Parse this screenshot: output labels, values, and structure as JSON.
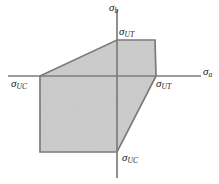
{
  "figure": {
    "background_color": "#ffffff",
    "fill_color": "#cccccc",
    "stroke_color": "#7a7a7a",
    "axis_color": "#7d7d7d",
    "width": 219,
    "height": 184
  },
  "axes": {
    "horizontal": {
      "name": "sigma-a-axis",
      "label_symbol": "σ",
      "label_subscript": "a",
      "x_start": 8,
      "x_end": 201,
      "y": 76
    },
    "vertical": {
      "name": "sigma-b-axis",
      "label_symbol": "σ",
      "label_subscript": "b",
      "x": 117,
      "y_start": 10,
      "y_end": 178
    }
  },
  "labels": {
    "sigma_b": {
      "symbol": "σ",
      "subscript": "b"
    },
    "sigma_a": {
      "symbol": "σ",
      "subscript": "a"
    },
    "sigma_ut_top": {
      "symbol": "σ",
      "subscript": "UT"
    },
    "sigma_ut_right": {
      "symbol": "σ",
      "subscript": "UT"
    },
    "sigma_uc_left": {
      "symbol": "σ",
      "subscript": "UC"
    },
    "sigma_uc_bottom": {
      "symbol": "σ",
      "subscript": "UC"
    }
  },
  "chart_data": {
    "type": "line",
    "xlabel": "σa",
    "ylabel": "σb",
    "grid": false,
    "legend": null,
    "origin_px": {
      "x": 117,
      "y": 76
    },
    "envelope_polygon_px": [
      {
        "x": 40,
        "y": 76
      },
      {
        "x": 117,
        "y": 40
      },
      {
        "x": 155,
        "y": 40
      },
      {
        "x": 156,
        "y": 76
      },
      {
        "x": 117,
        "y": 152
      },
      {
        "x": 40,
        "y": 152
      }
    ],
    "annotations": [
      {
        "text": "σUT",
        "at_px": {
          "x": 117,
          "y": 40
        },
        "meaning": "ultimate tensile strength on σb axis"
      },
      {
        "text": "σUT",
        "at_px": {
          "x": 156,
          "y": 76
        },
        "meaning": "ultimate tensile strength on σa axis"
      },
      {
        "text": "σUC",
        "at_px": {
          "x": 40,
          "y": 76
        },
        "meaning": "ultimate compressive strength on σa axis"
      },
      {
        "text": "σUC",
        "at_px": {
          "x": 117,
          "y": 152
        },
        "meaning": "ultimate compressive strength on σb axis"
      }
    ]
  }
}
